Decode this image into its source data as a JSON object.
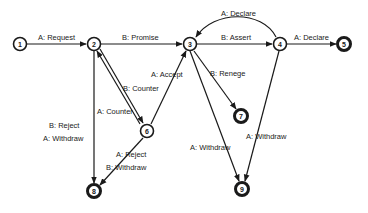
{
  "diagram": {
    "type": "state-transition",
    "colors": {
      "ink": "#1a1a1a",
      "background": "#ffffff"
    },
    "nodes": [
      {
        "id": "1",
        "label": "1",
        "terminal": false
      },
      {
        "id": "2",
        "label": "2",
        "terminal": false
      },
      {
        "id": "3",
        "label": "3",
        "terminal": false
      },
      {
        "id": "4",
        "label": "4",
        "terminal": false
      },
      {
        "id": "5",
        "label": "5",
        "terminal": true
      },
      {
        "id": "6",
        "label": "6",
        "terminal": false
      },
      {
        "id": "7",
        "label": "7",
        "terminal": true
      },
      {
        "id": "8",
        "label": "8",
        "terminal": true
      },
      {
        "id": "9",
        "label": "9",
        "terminal": true
      }
    ],
    "edges": [
      {
        "from": "1",
        "to": "2",
        "label": "A: Request"
      },
      {
        "from": "2",
        "to": "3",
        "label": "B: Promise"
      },
      {
        "from": "3",
        "to": "4",
        "label": "B: Assert"
      },
      {
        "from": "4",
        "to": "3",
        "label": "A: Declare"
      },
      {
        "from": "4",
        "to": "5",
        "label": "A: Declare"
      },
      {
        "from": "6",
        "to": "2",
        "label": "B: Counter"
      },
      {
        "from": "2",
        "to": "6",
        "label": "A: Counter"
      },
      {
        "from": "6",
        "to": "3",
        "label": "A: Accept"
      },
      {
        "from": "3",
        "to": "7",
        "label": "B: Renege"
      },
      {
        "from": "2",
        "to": "8",
        "label_lines": [
          "B: Reject",
          "A: Withdraw"
        ]
      },
      {
        "from": "6",
        "to": "8",
        "label_lines": [
          "A: Reject",
          "B: Withdraw"
        ]
      },
      {
        "from": "3",
        "to": "9",
        "label": "A: Withdraw"
      },
      {
        "from": "4",
        "to": "9",
        "label": "A: Withdraw"
      }
    ]
  }
}
